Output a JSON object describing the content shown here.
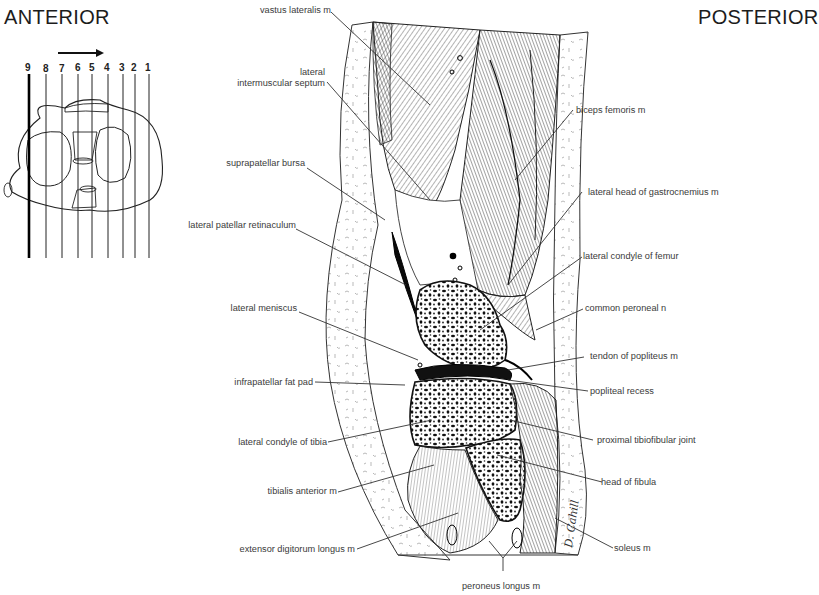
{
  "headings": {
    "anterior": "ANTERIOR",
    "posterior": "POSTERIOR"
  },
  "key_diagram": {
    "arrow_direction": "right",
    "section_numbers": [
      "9",
      "8",
      "7",
      "6",
      "5",
      "4",
      "3",
      "2",
      "1"
    ],
    "highlighted_section": "9"
  },
  "labels_left": [
    {
      "id": "vastus-lateralis",
      "text": "vastus lateralis m"
    },
    {
      "id": "lateral-intermuscular-septum-1",
      "text": "lateral"
    },
    {
      "id": "lateral-intermuscular-septum-2",
      "text": "intermuscular septum"
    },
    {
      "id": "suprapatellar-bursa",
      "text": "suprapatellar bursa"
    },
    {
      "id": "lateral-patellar-retinaculum",
      "text": "lateral patellar retinaculum"
    },
    {
      "id": "lateral-meniscus",
      "text": "lateral meniscus"
    },
    {
      "id": "infrapatellar-fat-pad",
      "text": "infrapatellar fat pad"
    },
    {
      "id": "lateral-condyle-tibia",
      "text": "lateral condyle of tibia"
    },
    {
      "id": "tibialis-anterior",
      "text": "tibialis anterior m"
    },
    {
      "id": "extensor-digitorum-longus",
      "text": "extensor digitorum longus m"
    }
  ],
  "labels_right": [
    {
      "id": "biceps-femoris",
      "text": "biceps femoris m"
    },
    {
      "id": "lateral-head-gastrocnemius",
      "text": "lateral head of gastrocnemius m"
    },
    {
      "id": "lateral-condyle-femur",
      "text": "lateral condyle of femur"
    },
    {
      "id": "common-peroneal",
      "text": "common peroneal n"
    },
    {
      "id": "tendon-popliteus",
      "text": "tendon of popliteus m"
    },
    {
      "id": "popliteal-recess",
      "text": "popliteal recess"
    },
    {
      "id": "proximal-tibiofibular-joint",
      "text": "proximal tibiofibular joint"
    },
    {
      "id": "head-fibula",
      "text": "head of fibula"
    },
    {
      "id": "soleus",
      "text": "soleus m"
    }
  ],
  "labels_bottom": [
    {
      "id": "peroneus-longus",
      "text": "peroneus longus m"
    }
  ],
  "signature": "D. Cahill"
}
